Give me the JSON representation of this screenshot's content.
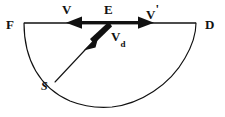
{
  "figure": {
    "type": "physics-vector-diagram",
    "background_color": "#ffffff",
    "stroke_color": "#111111",
    "labels": {
      "left_endpoint": "F",
      "right_endpoint": "D",
      "center_point": "E",
      "arc_point": "S",
      "velocity_left": "V",
      "velocity_right_base": "V",
      "velocity_right_prime": "'",
      "drift_velocity_base": "V",
      "drift_velocity_sub": "d"
    },
    "geometry": {
      "diameter_left_x": 24,
      "diameter_right_x": 196,
      "diameter_y": 23,
      "center_x": 110,
      "arc_bottom_y": 107,
      "arc_radius_x": 86,
      "arc_radius_y": 84,
      "left_arrow_tip_x": 66,
      "right_arrow_tip_x": 154,
      "drift_arrow_tip_x": 84,
      "drift_arrow_tip_y": 49,
      "radius_point_s_x": 55,
      "radius_point_s_y": 82
    }
  }
}
